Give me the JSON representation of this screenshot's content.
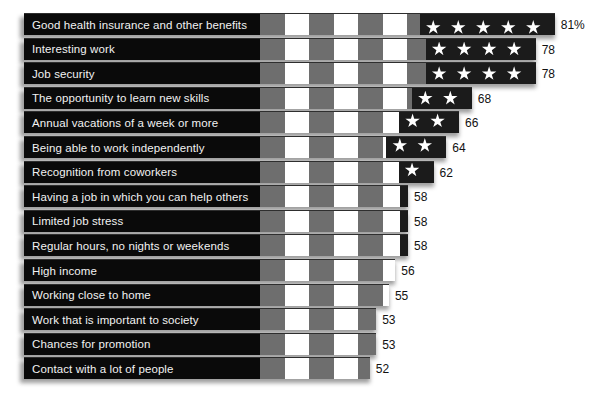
{
  "chart_data": {
    "type": "bar",
    "orientation": "horizontal",
    "title": "",
    "subtitle": "",
    "xlabel": "",
    "ylabel": "",
    "grid": false,
    "legend": null,
    "value_suffix_first": "%",
    "xlim": [
      0,
      85
    ],
    "categories": [
      "Good health insurance and other benefits",
      "Interesting work",
      "Job security",
      "The opportunity to learn new skills",
      "Annual vacations of a week or more",
      "Being able to work independently",
      "Recognition from coworkers",
      "Having a job in which you can help others",
      "Limited job stress",
      "Regular hours, no nights or weekends",
      "High income",
      "Working close to home",
      "Work that is important to society",
      "Chances for promotion",
      "Contact with a lot of people"
    ],
    "values": [
      81,
      78,
      78,
      68,
      66,
      64,
      62,
      58,
      58,
      58,
      56,
      55,
      53,
      53,
      52
    ],
    "value_labels": [
      "81%",
      "78",
      "78",
      "68",
      "66",
      "64",
      "62",
      "58",
      "58",
      "58",
      "56",
      "55",
      "53",
      "53",
      "52"
    ],
    "colors": {
      "bar_field": "#0a0a0a",
      "stripe_red": "#6e6e6e",
      "stripe_white": "#ffffff",
      "canton": "#1b1b1b",
      "star": "#ffffff",
      "label_text": "#f2f2f2",
      "value_text": "#111111",
      "background": "#ffffff",
      "shadow": "#8d8d8d"
    }
  },
  "rows": [
    {
      "label": "Good health insurance and other benefits",
      "value": 81,
      "value_label": "81%",
      "stars": 5,
      "star_style": "clipped-top"
    },
    {
      "label": "Interesting work",
      "value": 78,
      "value_label": "78",
      "stars": 4,
      "star_style": "full"
    },
    {
      "label": "Job security",
      "value": 78,
      "value_label": "78",
      "stars": 4,
      "star_style": "full"
    },
    {
      "label": "The opportunity to learn new skills",
      "value": 68,
      "value_label": "68",
      "stars": 2,
      "star_style": "full"
    },
    {
      "label": "Annual vacations of a week or more",
      "value": 66,
      "value_label": "66",
      "stars": 2,
      "star_style": "partial"
    },
    {
      "label": "Being able to work independently",
      "value": 64,
      "value_label": "64",
      "stars": 2,
      "star_style": "partial"
    },
    {
      "label": "Recognition from coworkers",
      "value": 62,
      "value_label": "62",
      "stars": 1,
      "star_style": "partial"
    },
    {
      "label": "Having a job in which you can help others",
      "value": 58,
      "value_label": "58",
      "stars": 0,
      "star_style": "none"
    },
    {
      "label": "Limited job stress",
      "value": 58,
      "value_label": "58",
      "stars": 0,
      "star_style": "none"
    },
    {
      "label": "Regular hours, no nights or weekends",
      "value": 58,
      "value_label": "58",
      "stars": 0,
      "star_style": "none"
    },
    {
      "label": "High income",
      "value": 56,
      "value_label": "56",
      "stars": 0,
      "star_style": "none"
    },
    {
      "label": "Working close to home",
      "value": 55,
      "value_label": "55",
      "stars": 0,
      "star_style": "none"
    },
    {
      "label": "Work that is important to society",
      "value": 53,
      "value_label": "53",
      "stars": 0,
      "star_style": "none"
    },
    {
      "label": "Chances for promotion",
      "value": 53,
      "value_label": "53",
      "stars": 0,
      "star_style": "none"
    },
    {
      "label": "Contact with a lot of people",
      "value": 52,
      "value_label": "52",
      "stars": 0,
      "star_style": "none"
    }
  ],
  "layout": {
    "bar_left_px": 24,
    "stripes_start_px": 260,
    "row_top_px": 13,
    "row_pitch_px": 24.6,
    "bar_height_px": 21,
    "px_per_unit": 6.38,
    "value_zero_px": 38
  }
}
